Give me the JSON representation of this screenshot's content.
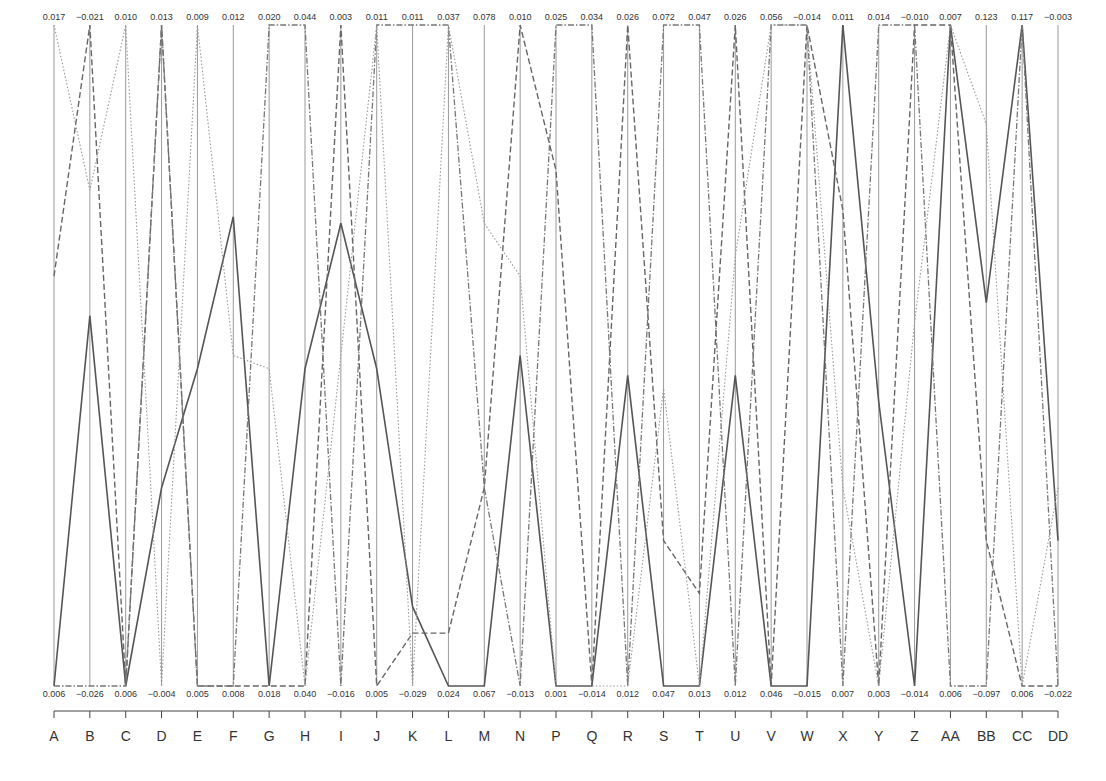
{
  "chart_data": {
    "type": "parallel_coordinates",
    "title": "",
    "axes": [
      "A",
      "B",
      "C",
      "D",
      "E",
      "F",
      "G",
      "H",
      "I",
      "J",
      "K",
      "L",
      "M",
      "N",
      "P",
      "Q",
      "R",
      "S",
      "T",
      "U",
      "V",
      "W",
      "X",
      "Y",
      "Z",
      "AA",
      "BB",
      "CC",
      "DD"
    ],
    "axis_top_values": [
      "0.017",
      "-0.021",
      "0.010",
      "0.013",
      "0.009",
      "0.012",
      "0.020",
      "0.044",
      "0.003",
      "0.011",
      "0.011",
      "0.037",
      "0.078",
      "0.010",
      "0.025",
      "0.034",
      "0.026",
      "0.072",
      "0.047",
      "0.026",
      "0.056",
      "-0.014",
      "0.011",
      "0.014",
      "-0.010",
      "0.007",
      "0.123",
      "0.117",
      "-0.003"
    ],
    "axis_bottom_values": [
      "0.006",
      "-0.026",
      "0.006",
      "-0.004",
      "0.005",
      "0.008",
      "0.018",
      "0.040",
      "-0.016",
      "0.005",
      "-0.029",
      "0.024",
      "0.067",
      "-0.013",
      "0.001",
      "-0.014",
      "0.012",
      "0.047",
      "0.013",
      "0.012",
      "0.046",
      "-0.015",
      "0.007",
      "0.003",
      "-0.014",
      "0.006",
      "-0.097",
      "0.006",
      "-0.022"
    ],
    "series": [
      {
        "name": "solid",
        "style": "solid",
        "normalized": [
          0.0,
          0.56,
          0.0,
          0.3,
          0.48,
          0.71,
          0.0,
          0.48,
          0.7,
          0.48,
          0.12,
          0.0,
          0.0,
          0.5,
          0.0,
          0.0,
          0.47,
          0.0,
          0.0,
          0.47,
          0.0,
          0.0,
          1.0,
          0.43,
          0.0,
          1.0,
          0.58,
          1.0,
          0.22
        ]
      },
      {
        "name": "dashed",
        "style": "dashed",
        "normalized": [
          0.62,
          1.0,
          0.0,
          1.0,
          0.0,
          0.0,
          0.0,
          0.0,
          1.0,
          0.0,
          0.08,
          0.08,
          0.3,
          1.0,
          0.78,
          0.0,
          1.0,
          0.22,
          0.14,
          1.0,
          0.0,
          1.0,
          0.72,
          0.0,
          1.0,
          1.0,
          0.22,
          0.0,
          0.0
        ]
      },
      {
        "name": "dashdot",
        "style": "dashdot",
        "normalized": [
          0.0,
          0.0,
          0.0,
          1.0,
          0.0,
          0.0,
          1.0,
          1.0,
          0.0,
          1.0,
          1.0,
          1.0,
          0.3,
          0.0,
          1.0,
          1.0,
          0.0,
          1.0,
          1.0,
          0.0,
          1.0,
          1.0,
          0.0,
          1.0,
          1.0,
          0.0,
          0.0,
          1.0,
          0.0
        ]
      },
      {
        "name": "dotted",
        "style": "dotted",
        "normalized": [
          1.0,
          0.75,
          1.0,
          0.0,
          1.0,
          0.5,
          0.48,
          0.0,
          0.5,
          1.0,
          0.0,
          1.0,
          0.7,
          0.62,
          0.0,
          0.0,
          0.0,
          0.45,
          0.0,
          0.65,
          1.0,
          1.0,
          0.3,
          0.0,
          0.55,
          1.0,
          0.85,
          0.0,
          0.3
        ]
      }
    ],
    "xlabel": "",
    "ylabel": "",
    "grid": false,
    "legend": "none"
  },
  "labels": {
    "axes": [
      "A",
      "B",
      "C",
      "D",
      "E",
      "F",
      "G",
      "H",
      "I",
      "J",
      "K",
      "L",
      "M",
      "N",
      "P",
      "Q",
      "R",
      "S",
      "T",
      "U",
      "V",
      "W",
      "X",
      "Y",
      "Z",
      "AA",
      "BB",
      "CC",
      "DD"
    ]
  }
}
